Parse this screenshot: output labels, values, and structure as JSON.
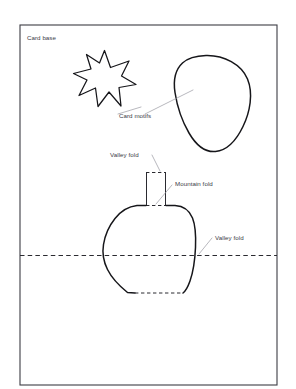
{
  "diagram": {
    "background_color": "#ffffff",
    "ink_color": "#16161a",
    "fold_color": "#2a2a30",
    "leader_color": "#9a9aa2",
    "text_color": "#3b3b46"
  },
  "labels": {
    "card_base": "Card base",
    "card_motifs": "Card motifs",
    "valley_fold_top": "Valley fold",
    "mountain_fold": "Mountain fold",
    "valley_fold_right": "Valley fold"
  },
  "shapes": {
    "card_base": {
      "name": "card-base-rectangle",
      "x": 20,
      "y": 25,
      "width": 257,
      "height": 360
    },
    "star_motif": {
      "name": "star-motif",
      "points": 6,
      "center_x": 103,
      "center_y": 80
    },
    "blob_motif": {
      "name": "blob-motif",
      "center_x": 208,
      "center_y": 100
    },
    "tab": {
      "name": "mountain-fold-tab",
      "left": 146,
      "right": 166,
      "top": 172,
      "bottom": 205
    },
    "vase": {
      "name": "vase-pop-up-shape",
      "top": 205,
      "bottom": 293
    },
    "horizontal_fold": {
      "name": "center-valley-fold-line",
      "y": 255,
      "x_start": 20,
      "x_end": 277
    }
  },
  "label_positions": {
    "card_base": {
      "x": 27,
      "y": 40
    },
    "card_motifs": {
      "x": 119,
      "y": 118
    },
    "valley_fold_top": {
      "x": 110,
      "y": 157
    },
    "mountain_fold": {
      "x": 175,
      "y": 186
    },
    "valley_fold_right": {
      "x": 215,
      "y": 240
    }
  }
}
